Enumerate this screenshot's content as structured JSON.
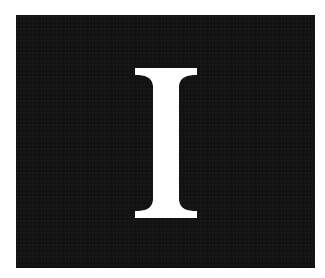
{
  "image": {
    "letter": "I",
    "colors": {
      "background": "#ffffff",
      "panel": "#141414",
      "letter": "#ffffff"
    }
  }
}
